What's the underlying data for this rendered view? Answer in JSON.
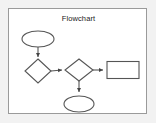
{
  "window": {
    "title": "Flowchart",
    "background_color": "#f2f2f2",
    "panel_color": "#ffffff",
    "border_color": "#9a9a9a"
  },
  "diagram": {
    "title": "Flowchart",
    "type": "flowchart",
    "stroke_color": "#555555",
    "fill_color": "#ffffff",
    "nodes": [
      {
        "id": "start",
        "shape": "ellipse",
        "label": "",
        "cx": 29,
        "cy": 30,
        "rx": 16,
        "ry": 8
      },
      {
        "id": "decision1",
        "shape": "diamond",
        "label": "",
        "cx": 29,
        "cy": 62,
        "rx": 13,
        "ry": 12
      },
      {
        "id": "decision2",
        "shape": "diamond",
        "label": "",
        "cx": 70,
        "cy": 61,
        "rx": 14,
        "ry": 11
      },
      {
        "id": "process",
        "shape": "rectangle",
        "label": "",
        "x": 98,
        "y": 52,
        "w": 32,
        "h": 17
      },
      {
        "id": "end",
        "shape": "ellipse",
        "label": "",
        "cx": 70,
        "cy": 95,
        "rx": 15,
        "ry": 8
      }
    ],
    "edges": [
      {
        "from": "start",
        "to": "decision1",
        "label": "",
        "direction": "down"
      },
      {
        "from": "decision1",
        "to": "decision2",
        "label": "",
        "direction": "right"
      },
      {
        "from": "decision2",
        "to": "process",
        "label": "",
        "direction": "right"
      },
      {
        "from": "decision2",
        "to": "end",
        "label": "",
        "direction": "down"
      }
    ]
  }
}
